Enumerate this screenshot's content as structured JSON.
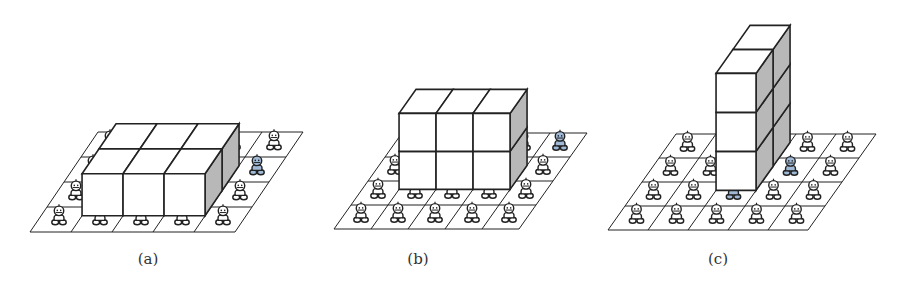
{
  "figure": {
    "grid": {
      "columns": 5,
      "rows": 4
    },
    "colors": {
      "line": "#222222",
      "cube_front": "#ffffff",
      "cube_top": "#ffffff",
      "cube_side": "#b8b8b8",
      "figure_normal": "#ffffff",
      "figure_covered": "#9fb9d6",
      "figure_stroke": "#222222"
    },
    "panels": [
      {
        "id": "a",
        "caption": "(a)",
        "block": {
          "width": 3,
          "depth": 2,
          "height": 1
        },
        "covered_cells": [
          [
            1,
            1
          ],
          [
            2,
            1
          ],
          [
            3,
            1
          ],
          [
            4,
            2
          ]
        ]
      },
      {
        "id": "b",
        "caption": "(b)",
        "block": {
          "width": 3,
          "depth": 1,
          "height": 2
        },
        "covered_cells": [
          [
            1,
            2
          ],
          [
            2,
            2
          ],
          [
            3,
            2
          ],
          [
            4,
            3
          ]
        ]
      },
      {
        "id": "c",
        "caption": "(c)",
        "block": {
          "width": 1,
          "depth": 2,
          "height": 3
        },
        "covered_cells": [
          [
            2,
            1
          ],
          [
            3,
            2
          ]
        ]
      }
    ]
  }
}
